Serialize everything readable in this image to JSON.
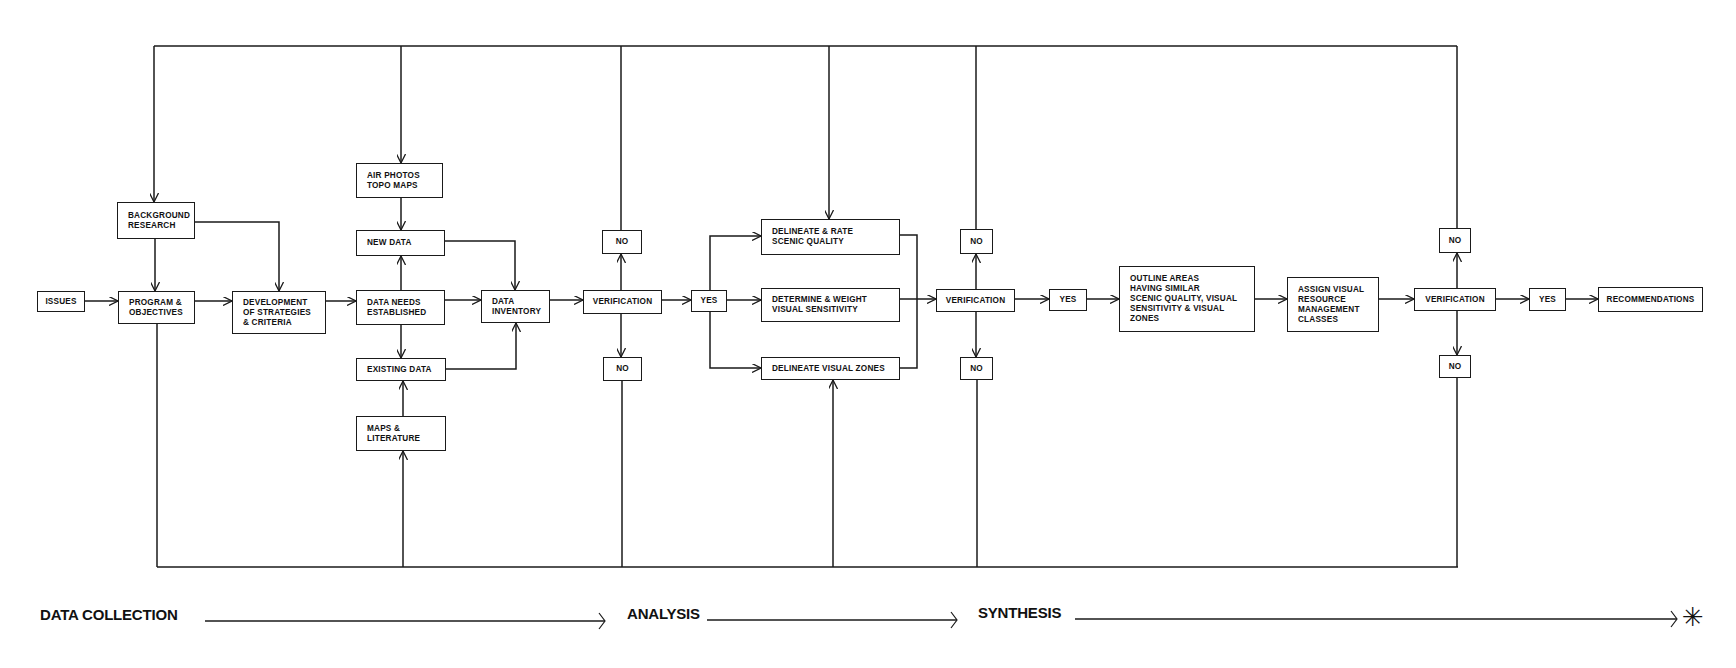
{
  "diagram": {
    "nodes": {
      "issues": "ISSUES",
      "background_research": "BACKGROUND\nRESEARCH",
      "program_objectives": "PROGRAM &\nOBJECTIVES",
      "development": "DEVELOPMENT\nOF STRATEGIES\n& CRITERIA",
      "air_photos": "AIR PHOTOS\nTOPO MAPS",
      "new_data": "NEW DATA",
      "data_needs": "DATA NEEDS\nESTABLISHED",
      "existing_data": "EXISTING DATA",
      "maps_literature": "MAPS &\nLITERATURE",
      "data_inventory": "DATA\nINVENTORY",
      "verification_1": "VERIFICATION",
      "no_1_top": "NO",
      "no_1_bottom": "NO",
      "yes_1": "YES",
      "delineate_rate": "DELINEATE & RATE\nSCENIC QUALITY",
      "determine_weight": "DETERMINE & WEIGHT\nVISUAL SENSITIVITY",
      "delineate_zones": "DELINEATE VISUAL ZONES",
      "verification_2": "VERIFICATION",
      "no_2_top": "NO",
      "no_2_bottom": "NO",
      "yes_2": "YES",
      "outline_areas": "OUTLINE AREAS\nHAVING SIMILAR\nSCENIC QUALITY, VISUAL\nSENSITIVITY & VISUAL\nZONES",
      "assign_classes": "ASSIGN VISUAL\nRESOURCE\nMANAGEMENT\nCLASSES",
      "verification_3": "VERIFICATION",
      "no_3_top": "NO",
      "no_3_bottom": "NO",
      "yes_3": "YES",
      "recommendations": "RECOMMENDATIONS"
    },
    "phases": {
      "data_collection": "DATA COLLECTION",
      "analysis": "ANALYSIS",
      "synthesis": "SYNTHESIS",
      "end_marker": "✳"
    },
    "colors": {
      "line": "#1a1a1a",
      "background": "#ffffff"
    }
  }
}
